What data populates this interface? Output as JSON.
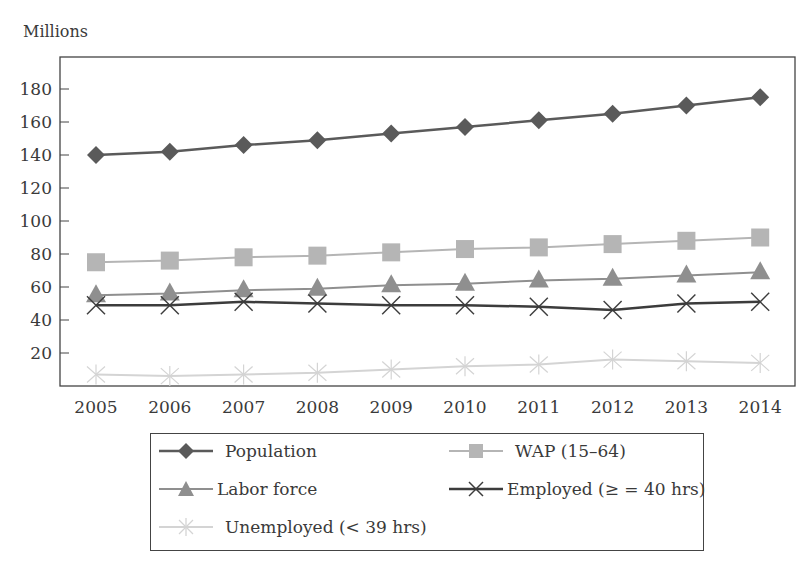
{
  "chart_data": {
    "type": "line",
    "title": "",
    "ylabel": "Millions",
    "xlabel": "",
    "ylim": [
      0,
      200
    ],
    "yticks": [
      20,
      40,
      60,
      80,
      100,
      120,
      140,
      160,
      180
    ],
    "grid": false,
    "legend_position": "bottom-boxed",
    "x": [
      "2005",
      "2006",
      "2007",
      "2008",
      "2009",
      "2010",
      "2011",
      "2012",
      "2013",
      "2014"
    ],
    "series": [
      {
        "name": "Population",
        "marker": "diamond",
        "color": "#5a5a5a",
        "line_width": 2.5,
        "values": [
          140,
          142,
          146,
          149,
          153,
          157,
          161,
          165,
          170,
          175
        ]
      },
      {
        "name": "WAP (15–64)",
        "marker": "square",
        "color": "#b5b5b5",
        "line_width": 2,
        "values": [
          75,
          76,
          78,
          79,
          81,
          83,
          84,
          86,
          88,
          90
        ]
      },
      {
        "name": "Labor force",
        "marker": "triangle",
        "color": "#8f8f8f",
        "line_width": 2,
        "values": [
          55,
          56,
          58,
          59,
          61,
          62,
          64,
          65,
          67,
          69
        ]
      },
      {
        "name": "Employed (≥ = 40 hrs)",
        "marker": "x",
        "color": "#3c3c3c",
        "line_width": 2.5,
        "values": [
          49,
          49,
          51,
          50,
          49,
          49,
          48,
          46,
          50,
          51
        ]
      },
      {
        "name": "Unemployed (< 39 hrs)",
        "marker": "asterisk",
        "color": "#d4d4d4",
        "line_width": 2,
        "values": [
          7,
          6,
          7,
          8,
          10,
          12,
          13,
          16,
          15,
          14
        ]
      }
    ]
  },
  "legend": {
    "items": [
      {
        "label": "Population"
      },
      {
        "label": "WAP (15–64)"
      },
      {
        "label": "Labor force"
      },
      {
        "label": "Employed (≥ = 40 hrs)"
      },
      {
        "label": "Unemployed (< 39 hrs)"
      }
    ]
  }
}
